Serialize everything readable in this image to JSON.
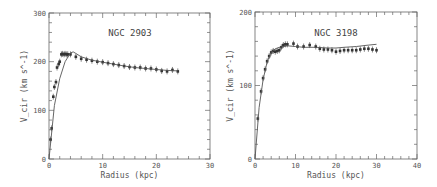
{
  "chart_data": [
    {
      "type": "scatter",
      "title": "NGC 2903",
      "xlabel": "Radius (kpc)",
      "ylabel": "V_cir (km s^-1)",
      "xlim": [
        0,
        30
      ],
      "ylim": [
        0,
        300
      ],
      "xticks": [
        "0",
        "10",
        "20",
        "30"
      ],
      "yticks": [
        "0",
        "100",
        "200",
        "300"
      ],
      "grid": false,
      "series": [
        {
          "name": "observed",
          "style": "points-with-errorbars",
          "x": [
            0.3,
            0.5,
            0.8,
            1.0,
            1.3,
            1.5,
            1.8,
            2.0,
            2.3,
            2.5,
            2.8,
            3.0,
            3.3,
            3.5,
            4.0,
            5.0,
            6.0,
            7.0,
            8.0,
            9.0,
            10.0,
            11.0,
            12.0,
            13.0,
            14.0,
            15.0,
            16.0,
            17.0,
            18.0,
            19.0,
            20.0,
            21.0,
            22.0,
            23.0,
            24.0
          ],
          "y": [
            40,
            63,
            128,
            148,
            158,
            188,
            195,
            200,
            215,
            216,
            215,
            216,
            215,
            215,
            215,
            210,
            206,
            204,
            202,
            200,
            199,
            197,
            195,
            193,
            191,
            189,
            188,
            188,
            186,
            186,
            184,
            181,
            180,
            183,
            180
          ]
        },
        {
          "name": "model",
          "style": "line",
          "x": [
            0,
            1,
            2,
            3,
            4,
            4.5,
            5,
            6,
            8,
            10,
            12,
            14,
            16,
            18,
            20,
            22,
            24
          ],
          "y": [
            0,
            110,
            165,
            200,
            218,
            220,
            217,
            210,
            203,
            199,
            195,
            191,
            188,
            186,
            184,
            182,
            181
          ]
        }
      ]
    },
    {
      "type": "scatter",
      "title": "NGC 3198",
      "xlabel": "Radius (kpc)",
      "ylabel": "V_cir (km s^-1)",
      "xlim": [
        0,
        40
      ],
      "ylim": [
        0,
        200
      ],
      "xticks": [
        "0",
        "10",
        "20",
        "30",
        "40"
      ],
      "yticks": [
        "0",
        "100",
        "200"
      ],
      "grid": false,
      "series": [
        {
          "name": "observed",
          "style": "points-with-errorbars",
          "x": [
            0.7,
            1.5,
            2.0,
            2.5,
            3.0,
            3.5,
            4.0,
            4.5,
            5.0,
            5.5,
            6.0,
            6.5,
            7.0,
            7.5,
            8.0,
            9.5,
            10.5,
            12.0,
            13.5,
            15.0,
            16.0,
            17.0,
            18.0,
            19.0,
            20.0,
            21.0,
            22.0,
            23.0,
            24.0,
            25.0,
            26.0,
            27.0,
            28.0,
            29.0,
            30.0
          ],
          "y": [
            55,
            92,
            110,
            122,
            133,
            140,
            145,
            147,
            146,
            147,
            148,
            152,
            155,
            156,
            156,
            157,
            153,
            153,
            155,
            153,
            150,
            149,
            149,
            148,
            146,
            147,
            148,
            148,
            148,
            148,
            149,
            150,
            150,
            149,
            148
          ]
        },
        {
          "name": "model",
          "style": "line",
          "x": [
            0,
            1,
            2,
            3,
            4,
            5,
            6,
            8,
            10,
            12,
            15,
            18,
            20,
            22,
            25,
            28,
            30
          ],
          "y": [
            0,
            70,
            108,
            132,
            145,
            150,
            152,
            154,
            153,
            152,
            152,
            151,
            151,
            152,
            153,
            155,
            156
          ]
        }
      ]
    }
  ]
}
